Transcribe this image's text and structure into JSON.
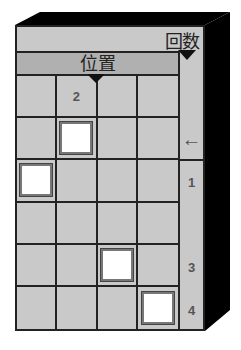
{
  "header": {
    "count_label": "回数",
    "position_label": "位置"
  },
  "grid": {
    "rows": 6,
    "cols": 4,
    "cells": [
      [
        "",
        "2",
        "",
        ""
      ],
      [
        "",
        "[ ]",
        "",
        ""
      ],
      [
        "[ ]",
        "",
        "",
        ""
      ],
      [
        "",
        "",
        "",
        ""
      ],
      [
        "",
        "",
        "[ ]",
        ""
      ],
      [
        "",
        "",
        "",
        "[ ]"
      ]
    ],
    "highlighted_cells": [
      {
        "row": 2,
        "col": 2
      },
      {
        "row": 3,
        "col": 1
      },
      {
        "row": 5,
        "col": 3
      },
      {
        "row": 6,
        "col": 4
      }
    ],
    "row1_col2_label": "2"
  },
  "right_column": {
    "labels": [
      "",
      "←",
      "1",
      "",
      "3",
      "4"
    ]
  },
  "colors": {
    "face": "#c9c9c9",
    "header": "#b0b0b0",
    "side": "#000000",
    "lines": "#222222",
    "highlight": "#ffffff"
  }
}
